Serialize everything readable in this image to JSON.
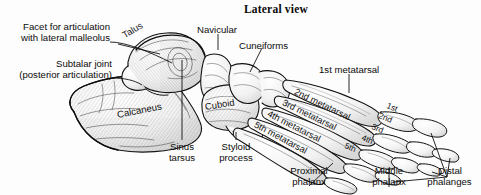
{
  "figure": {
    "title": "Lateral view",
    "background_color": "#fdfdfd",
    "ink_color": "#111111"
  },
  "callouts": {
    "facet": "Facet for articulation",
    "facet2": "with lateral malleolus",
    "subtalar": "Subtalar joint",
    "subtalar2": "(posterior articulation)",
    "navicular": "Navicular",
    "cuneiforms": "Cuneiforms",
    "first_metatarsal": "1st metatarsal",
    "sinus": "Sinus",
    "sinus2": "tarsus",
    "styloid": "Styloid",
    "styloid2": "process",
    "proximal": "Proximal",
    "proximal2": "phalanx",
    "middle": "Middle",
    "middle2": "phalanx",
    "distal": "Distal",
    "distal2": "phalanges"
  },
  "bone_labels": {
    "talus": "Talus",
    "calcaneus": "Calcaneus",
    "cuboid": "Cuboid",
    "metatarsal_2": "2nd metatarsal",
    "metatarsal_3": "3rd metatarsal",
    "metatarsal_4": "4th metatarsal",
    "metatarsal_5": "5th metatarsal",
    "digit_1": "1st",
    "digit_2": "2nd",
    "digit_3": "3rd",
    "digit_4": "4th",
    "digit_5": "5th"
  }
}
